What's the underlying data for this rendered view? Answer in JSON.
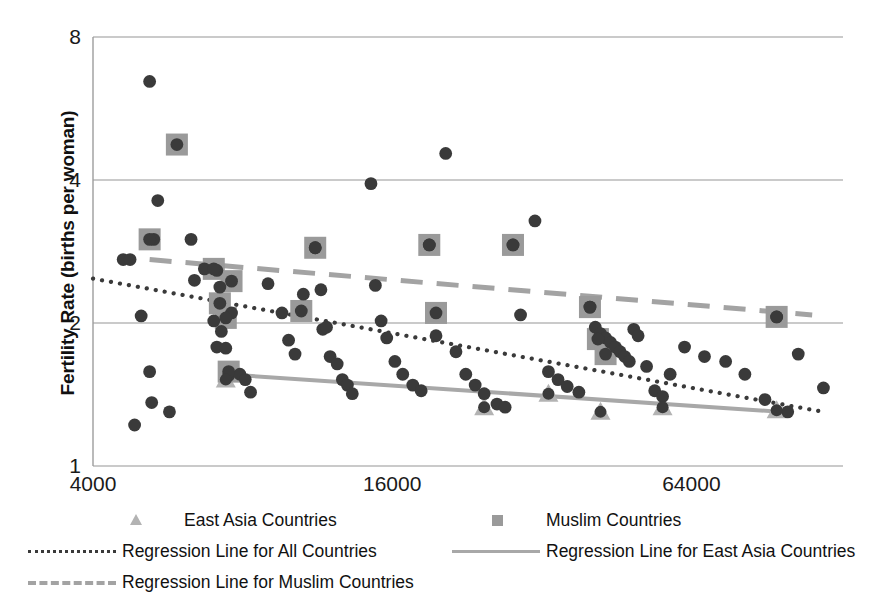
{
  "chart_data": {
    "type": "scatter",
    "title": "",
    "xlabel": "",
    "ylabel": "Fertility Rate (births per woman)",
    "x_scale": "log",
    "y_scale": "log",
    "xlim": [
      4000,
      128000
    ],
    "ylim": [
      1,
      8
    ],
    "xticks": [
      "4000",
      "16000",
      "64000"
    ],
    "xtick_values": [
      4000,
      16000,
      64000
    ],
    "yticks": [
      "1",
      "2",
      "4",
      "8"
    ],
    "ytick_values": [
      1,
      2,
      4,
      8
    ],
    "grid": "horizontal",
    "legend_position": "bottom",
    "series": [
      {
        "name": "All Countries",
        "marker": "circle",
        "color": "#3a3a3a",
        "points": [
          [
            5200,
            6.45
          ],
          [
            5400,
            3.62
          ],
          [
            5300,
            3.0
          ],
          [
            5000,
            2.07
          ],
          [
            4600,
            2.72
          ],
          [
            4750,
            2.72
          ],
          [
            5200,
            1.58
          ],
          [
            5250,
            1.36
          ],
          [
            5700,
            1.3
          ],
          [
            4850,
            1.22
          ],
          [
            6300,
            3.0
          ],
          [
            6400,
            2.46
          ],
          [
            6700,
            2.6
          ],
          [
            7100,
            2.58
          ],
          [
            7000,
            2.02
          ],
          [
            7200,
            2.38
          ],
          [
            7250,
            1.92
          ],
          [
            7100,
            1.78
          ],
          [
            7400,
            1.77
          ],
          [
            7600,
            2.1
          ],
          [
            7500,
            1.55
          ],
          [
            7900,
            1.56
          ],
          [
            8100,
            1.52
          ],
          [
            8300,
            1.43
          ],
          [
            9000,
            2.42
          ],
          [
            9600,
            2.1
          ],
          [
            9900,
            1.84
          ],
          [
            10200,
            1.72
          ],
          [
            10600,
            2.3
          ],
          [
            11200,
            2.88
          ],
          [
            11500,
            2.35
          ],
          [
            11600,
            1.94
          ],
          [
            11800,
            1.96
          ],
          [
            12000,
            1.7
          ],
          [
            12400,
            1.64
          ],
          [
            12700,
            1.52
          ],
          [
            13000,
            1.48
          ],
          [
            13300,
            1.42
          ],
          [
            14500,
            3.93
          ],
          [
            14800,
            2.4
          ],
          [
            15200,
            2.02
          ],
          [
            15600,
            1.86
          ],
          [
            16200,
            1.66
          ],
          [
            16800,
            1.56
          ],
          [
            17600,
            1.48
          ],
          [
            18300,
            1.44
          ],
          [
            19000,
            2.92
          ],
          [
            19600,
            1.88
          ],
          [
            20500,
            4.55
          ],
          [
            21500,
            1.74
          ],
          [
            22500,
            1.56
          ],
          [
            23500,
            1.48
          ],
          [
            24500,
            1.42
          ],
          [
            26000,
            1.35
          ],
          [
            27000,
            1.33
          ],
          [
            28000,
            2.92
          ],
          [
            29000,
            2.08
          ],
          [
            31000,
            3.28
          ],
          [
            33000,
            1.58
          ],
          [
            34500,
            1.52
          ],
          [
            36000,
            1.47
          ],
          [
            38000,
            1.43
          ],
          [
            40000,
            2.16
          ],
          [
            41000,
            1.96
          ],
          [
            42000,
            1.9
          ],
          [
            43000,
            1.86
          ],
          [
            44000,
            1.82
          ],
          [
            45000,
            1.78
          ],
          [
            46000,
            1.74
          ],
          [
            47000,
            1.7
          ],
          [
            48000,
            1.66
          ],
          [
            49000,
            1.94
          ],
          [
            50000,
            1.88
          ],
          [
            52000,
            1.62
          ],
          [
            54000,
            1.44
          ],
          [
            56000,
            1.4
          ],
          [
            58000,
            1.56
          ],
          [
            62000,
            1.78
          ],
          [
            68000,
            1.7
          ],
          [
            75000,
            1.66
          ],
          [
            82000,
            1.56
          ],
          [
            95000,
            2.06
          ],
          [
            105000,
            1.72
          ],
          [
            118000,
            1.46
          ],
          [
            90000,
            1.38
          ],
          [
            100000,
            1.3
          ]
        ]
      },
      {
        "name": "Muslim Countries",
        "marker": "square",
        "color": "#9a9a9a",
        "points": [
          [
            5900,
            4.75
          ],
          [
            5200,
            3.0
          ],
          [
            7000,
            2.6
          ],
          [
            7200,
            2.2
          ],
          [
            7400,
            2.05
          ],
          [
            7600,
            2.45
          ],
          [
            7500,
            1.58
          ],
          [
            11200,
            2.88
          ],
          [
            10500,
            2.12
          ],
          [
            19000,
            2.92
          ],
          [
            19600,
            2.1
          ],
          [
            28000,
            2.92
          ],
          [
            40000,
            2.16
          ],
          [
            41500,
            1.85
          ],
          [
            43000,
            1.72
          ],
          [
            95000,
            2.06
          ]
        ]
      },
      {
        "name": "East Asia Countries",
        "marker": "triangle",
        "color": "#b3b3b3",
        "points": [
          [
            7400,
            1.52
          ],
          [
            24500,
            1.33
          ],
          [
            33000,
            1.42
          ],
          [
            42000,
            1.3
          ],
          [
            56000,
            1.33
          ],
          [
            95000,
            1.31
          ]
        ]
      }
    ],
    "regression_lines": [
      {
        "name": "Regression Line for All Countries",
        "style": "dotted",
        "color": "#3a3a3a",
        "x_start": 4000,
        "y_start": 2.48,
        "x_end": 118000,
        "y_end": 1.3
      },
      {
        "name": "Regression Line for Muslim Countries",
        "style": "dashed",
        "color": "#a3a3a3",
        "x_start": 5200,
        "y_start": 2.72,
        "x_end": 112000,
        "y_end": 2.08
      },
      {
        "name": "Regression Line for East Asia Countries",
        "style": "solid",
        "color": "#a8a8a8",
        "x_start": 7400,
        "y_start": 1.56,
        "x_end": 97000,
        "y_end": 1.3
      }
    ]
  },
  "axes": {
    "y_title": "Fertility Rate (births per woman)",
    "y_ticks": [
      {
        "label": "8",
        "value": 8
      },
      {
        "label": "4",
        "value": 4
      },
      {
        "label": "2",
        "value": 2
      },
      {
        "label": "1",
        "value": 1
      }
    ],
    "x_ticks": [
      {
        "label": "4000",
        "value": 4000
      },
      {
        "label": "16000",
        "value": 16000
      },
      {
        "label": "64000",
        "value": 64000
      }
    ]
  },
  "legend": {
    "items": [
      {
        "key": "triangle-marker-icon",
        "label": "East Asia Countries"
      },
      {
        "key": "square-marker-icon",
        "label": "Muslim Countries"
      },
      {
        "key": "dotted-line-icon",
        "label": "Regression Line for All Countries"
      },
      {
        "key": "solid-line-icon",
        "label": "Regression Line for East Asia Countries"
      },
      {
        "key": "dashed-line-icon",
        "label": "Regression Line for Muslim Countries"
      }
    ]
  },
  "colors": {
    "point": "#3a3a3a",
    "muslim": "#9a9a9a",
    "eastasia": "#b3b3b3",
    "grid": "#b9b9b9",
    "axis": "#9d9d9d",
    "text": "#111111"
  }
}
